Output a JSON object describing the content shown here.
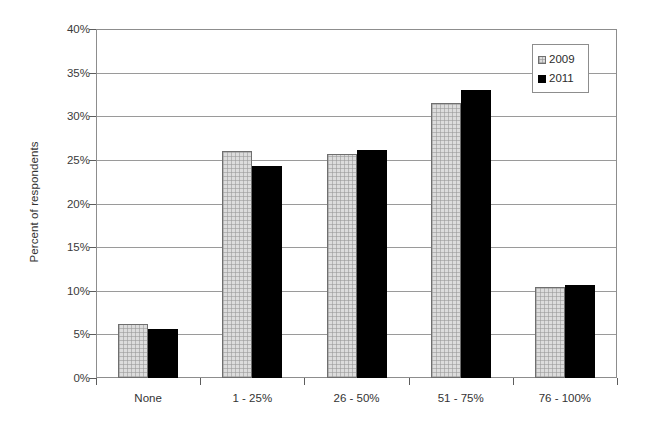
{
  "chart_data": {
    "type": "bar",
    "title": "",
    "subtitle": "",
    "xlabel": "",
    "ylabel": "Percent of respondents",
    "categories": [
      "None",
      "1 - 25%",
      "26 - 50%",
      "51 - 75%",
      "76 - 100%"
    ],
    "series": [
      {
        "name": "2009",
        "values": [
          6.2,
          26.0,
          25.7,
          31.5,
          10.4
        ],
        "color": "#dcdcdc"
      },
      {
        "name": "2011",
        "values": [
          5.6,
          24.3,
          26.1,
          33.0,
          10.7
        ],
        "color": "#000000"
      }
    ],
    "ylim": [
      0,
      40
    ],
    "ytick_values": [
      0,
      5,
      10,
      15,
      20,
      25,
      30,
      35,
      40
    ],
    "ytick_labels": [
      "0%",
      "5%",
      "10%",
      "15%",
      "20%",
      "25%",
      "30%",
      "35%",
      "40%"
    ],
    "grid": true,
    "grid_axis": "y",
    "legend_position": "top-right",
    "legend_entries": [
      "2009",
      "2011"
    ]
  },
  "axes": {
    "y_title": "Percent of respondents"
  },
  "legend": {
    "items": [
      {
        "label": "2009",
        "swatch": "light-gray-textured-square-icon"
      },
      {
        "label": "2011",
        "swatch": "black-square-icon"
      }
    ]
  }
}
